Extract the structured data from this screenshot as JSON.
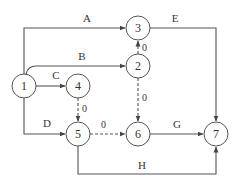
{
  "diagram": {
    "type": "activity-on-arrow network",
    "nodes": [
      {
        "id": "1",
        "label": "1"
      },
      {
        "id": "2",
        "label": "2"
      },
      {
        "id": "3",
        "label": "3"
      },
      {
        "id": "4",
        "label": "4"
      },
      {
        "id": "5",
        "label": "5"
      },
      {
        "id": "6",
        "label": "6"
      },
      {
        "id": "7",
        "label": "7"
      }
    ],
    "edges": [
      {
        "from": "1",
        "to": "3",
        "label": "A",
        "style": "solid"
      },
      {
        "from": "1",
        "to": "2",
        "label": "B",
        "style": "solid"
      },
      {
        "from": "1",
        "to": "4",
        "label": "C",
        "style": "solid"
      },
      {
        "from": "1",
        "to": "5",
        "label": "D",
        "style": "solid"
      },
      {
        "from": "3",
        "to": "7",
        "label": "E",
        "style": "solid"
      },
      {
        "from": "6",
        "to": "7",
        "label": "G",
        "style": "solid"
      },
      {
        "from": "5",
        "to": "7",
        "label": "H",
        "style": "solid"
      },
      {
        "from": "2",
        "to": "3",
        "label": "0",
        "style": "dashed"
      },
      {
        "from": "2",
        "to": "6",
        "label": "0",
        "style": "dashed"
      },
      {
        "from": "4",
        "to": "5",
        "label": "0",
        "style": "dashed"
      },
      {
        "from": "5",
        "to": "6",
        "label": "0",
        "style": "dashed"
      }
    ]
  }
}
